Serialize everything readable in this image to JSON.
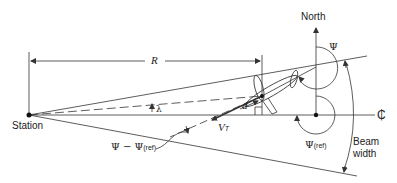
{
  "diagram": {
    "labels": {
      "north": "North",
      "station": "Station",
      "range": "R",
      "lambda": "λ",
      "distance": "d",
      "velocity": "V",
      "velocity_sub": "T",
      "heading": "Ψ",
      "heading_ref": "Ψ",
      "heading_ref_sub": "(ref)",
      "heading_diff": "Ψ − Ψ",
      "heading_diff_sub": "(ref)",
      "centerline": "₵",
      "beam_width_line1": "Beam",
      "beam_width_line2": "width"
    },
    "colors": {
      "line": "#333333",
      "text": "#222222",
      "background": "#ffffff"
    }
  }
}
